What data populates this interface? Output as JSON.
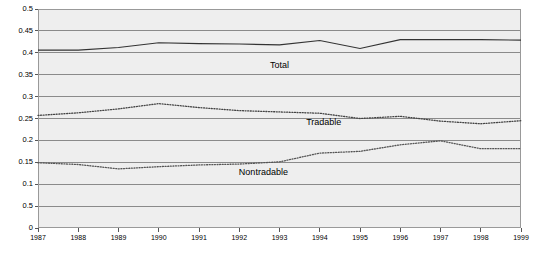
{
  "chart_data": {
    "type": "line",
    "title": "",
    "xlabel": "",
    "ylabel": "",
    "x": [
      1987,
      1988,
      1989,
      1990,
      1991,
      1992,
      1993,
      1994,
      1995,
      1996,
      1997,
      1998,
      1999
    ],
    "categories": [
      "1987",
      "1988",
      "1989",
      "1990",
      "1991",
      "1992",
      "1993",
      "1994",
      "1995",
      "1996",
      "1997",
      "1998",
      "1999"
    ],
    "xlim": [
      1987,
      1999
    ],
    "ylim": [
      0,
      0.5
    ],
    "yticks": [
      0,
      0.05,
      0.1,
      0.15,
      0.2,
      0.25,
      0.3,
      0.35,
      0.4,
      0.45,
      0.5
    ],
    "ytick_labels": [
      "0",
      "0.5",
      "0.1",
      "0.15",
      "0.2",
      "0.25",
      "0.3",
      "0.35",
      "0.4",
      "0.45",
      "0.5"
    ],
    "grid": true,
    "grid_axis": "y",
    "legend_position": "inline-annotations",
    "series": [
      {
        "name": "Total",
        "style": "solid",
        "color": "#333333",
        "label_text": "Total",
        "values": [
          0.406,
          0.406,
          0.412,
          0.423,
          0.421,
          0.42,
          0.418,
          0.428,
          0.41,
          0.43,
          0.43,
          0.43,
          0.429
        ]
      },
      {
        "name": "Tradable",
        "style": "dotted",
        "color": "#444444",
        "label_text": "Tradable",
        "values": [
          0.257,
          0.263,
          0.272,
          0.284,
          0.275,
          0.268,
          0.265,
          0.262,
          0.25,
          0.255,
          0.244,
          0.238,
          0.245
        ]
      },
      {
        "name": "Nontradable",
        "style": "dotted",
        "color": "#555555",
        "label_text": "Nontradable",
        "values": [
          0.149,
          0.145,
          0.135,
          0.14,
          0.144,
          0.146,
          0.151,
          0.171,
          0.175,
          0.19,
          0.199,
          0.181,
          0.181
        ]
      }
    ],
    "annotations": [
      {
        "text": "Total",
        "x": 1993.0,
        "y": 0.372
      },
      {
        "text": "Tradable",
        "x": 1994.1,
        "y": 0.243
      },
      {
        "text": "Nontradable",
        "x": 1992.6,
        "y": 0.128
      }
    ]
  }
}
